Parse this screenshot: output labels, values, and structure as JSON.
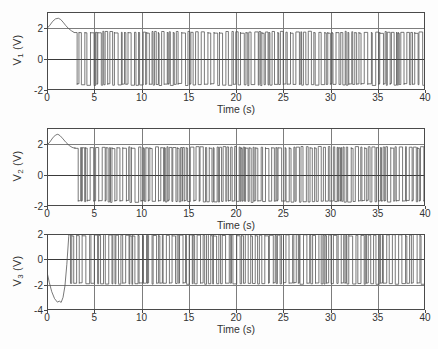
{
  "figure": {
    "background": "#ffffff",
    "trace_color": "#4c4c4c",
    "axis_color": "#4a4a4a",
    "grid_color": "#7d7d7d"
  },
  "chart_data": [
    {
      "type": "line",
      "panel_index": 0,
      "title": "",
      "xlabel": "Time (s)",
      "ylabel": "V1 (V)",
      "ylabel_base": "V",
      "ylabel_sub": "1",
      "ylabel_unit": "(V)",
      "xlim": [
        0,
        40
      ],
      "ylim": [
        -2,
        3
      ],
      "xticks": [
        0,
        5,
        10,
        15,
        20,
        25,
        30,
        35,
        40
      ],
      "xticklabels": [
        "0",
        "5",
        "10",
        "15",
        "20",
        "25",
        "30",
        "35",
        "40"
      ],
      "yticks": [
        -2,
        0,
        2
      ],
      "yticklabels": [
        "-2",
        "0",
        "2"
      ],
      "grid": true,
      "legend": null,
      "description": "Chaotic oscillator voltage V1: smooth transient hump rising from 1.95 V to a 2.6 V peak near t=1.3 s, decaying to 1.7 V by t=2.8 s, then sustained irregular square-wave switching between -1.65 V and +1.7 V for the remainder of the record.",
      "transient": {
        "x": [
          0.0,
          0.3,
          0.6,
          0.9,
          1.2,
          1.45,
          1.7,
          2.0,
          2.3,
          2.6,
          2.85
        ],
        "y": [
          1.95,
          2.15,
          2.4,
          2.56,
          2.6,
          2.52,
          2.35,
          2.12,
          1.93,
          1.79,
          1.7
        ]
      },
      "oscillation": {
        "start_time": 2.85,
        "end_time": 40.0,
        "high_level": 1.7,
        "low_level": -1.65,
        "approx_cycles": 118,
        "waveform": "irregular-width bipolar square pulses"
      }
    },
    {
      "type": "line",
      "panel_index": 1,
      "title": "",
      "xlabel": "Time (s)",
      "ylabel": "V2 (V)",
      "ylabel_base": "V",
      "ylabel_sub": "2",
      "ylabel_unit": "(V)",
      "xlim": [
        0,
        40
      ],
      "ylim": [
        -2,
        3
      ],
      "xticks": [
        0,
        5,
        10,
        15,
        20,
        25,
        30,
        35,
        40
      ],
      "xticklabels": [
        "0",
        "5",
        "10",
        "15",
        "20",
        "25",
        "30",
        "35",
        "40"
      ],
      "yticks": [
        -2,
        0,
        2
      ],
      "yticklabels": [
        "-2",
        "0",
        "2"
      ],
      "grid": true,
      "legend": null,
      "description": "Chaotic oscillator voltage V2: transient hump from 1.9 V peaking at 2.6 V near t=1.3 s, settling to 1.7 V by t=2.9 s, followed by dense irregular square-wave switching between -1.7 V and +1.75 V.",
      "transient": {
        "x": [
          0.0,
          0.3,
          0.6,
          0.9,
          1.15,
          1.4,
          1.7,
          2.0,
          2.35,
          2.65,
          2.95
        ],
        "y": [
          1.9,
          2.1,
          2.36,
          2.55,
          2.6,
          2.5,
          2.3,
          2.08,
          1.88,
          1.76,
          1.7
        ]
      },
      "oscillation": {
        "start_time": 2.95,
        "end_time": 40.0,
        "high_level": 1.75,
        "low_level": -1.7,
        "approx_cycles": 120,
        "waveform": "irregular-width bipolar square pulses"
      }
    },
    {
      "type": "line",
      "panel_index": 2,
      "title": "",
      "xlabel": "Time (s)",
      "ylabel": "V3 (V)",
      "ylabel_base": "V",
      "ylabel_sub": "3",
      "ylabel_unit": "(V)",
      "xlim": [
        0,
        40
      ],
      "ylim": [
        -4,
        2
      ],
      "xticks": [
        0,
        5,
        10,
        15,
        20,
        25,
        30,
        35,
        40
      ],
      "xticklabels": [
        "0",
        "5",
        "10",
        "15",
        "20",
        "25",
        "30",
        "35",
        "40"
      ],
      "yticks": [
        -4,
        -2,
        0,
        2
      ],
      "yticklabels": [
        "-4",
        "-2",
        "0",
        "2"
      ],
      "grid": true,
      "legend": null,
      "description": "Chaotic oscillator voltage V3: starts near -1.0 V, plunges to a -3.4 V trough between t=1.1 and t=1.6 s, then rises steeply through zero to +1.8 V at t=2.3 s, after which it switches irregularly between -1.9 V and +1.9 V.",
      "transient": {
        "x": [
          0.0,
          0.25,
          0.5,
          0.8,
          1.1,
          1.3,
          1.5,
          1.7,
          1.9,
          2.1,
          2.3
        ],
        "y": [
          -1.0,
          -1.85,
          -2.55,
          -3.1,
          -3.38,
          -3.3,
          -3.4,
          -3.0,
          -2.1,
          -0.4,
          1.8
        ]
      },
      "oscillation": {
        "start_time": 2.3,
        "end_time": 40.0,
        "high_level": 1.9,
        "low_level": -1.9,
        "approx_cycles": 115,
        "waveform": "irregular-width bipolar square pulses"
      }
    }
  ]
}
